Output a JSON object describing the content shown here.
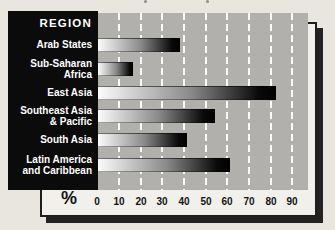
{
  "colors": {
    "page_bg": "#e9e6e0",
    "frame_bg": "#f2f0ea",
    "frame_border": "#1e1e1e",
    "shadow": "#222220",
    "plot_bg": "#b1b0ad",
    "panel_bg": "#0b0b0b",
    "gridline": "#ffffff",
    "label_text": "#ffffff",
    "axis_text": "#141414",
    "bar_gradient_start": "#fbfbfb",
    "bar_gradient_end": "#000000"
  },
  "chart_data": {
    "type": "bar",
    "orientation": "horizontal",
    "column_header": "REGION",
    "categories": [
      "Arab States",
      "Sub-Saharan Africa",
      "East Asia",
      "Southeast Asia & Pacific",
      "South Asia",
      "Latin America and Caribbean"
    ],
    "values": [
      38,
      16,
      82,
      54,
      41,
      61
    ],
    "xlabel": "%",
    "x_ticks": [
      "0",
      "10",
      "20",
      "30",
      "40",
      "50",
      "60",
      "70",
      "80",
      "90"
    ],
    "xlim": [
      0,
      97
    ],
    "grid": "vertical-dashed-white",
    "legend": "none",
    "bar_style": "white-to-black horizontal gradient"
  },
  "regions": [
    {
      "label": "Arab States",
      "value": 38
    },
    {
      "label": "Sub-Saharan\nAfrica",
      "value": 16
    },
    {
      "label": "East Asia",
      "value": 82
    },
    {
      "label": "Southeast Asia\n& Pacific",
      "value": 54
    },
    {
      "label": "South Asia",
      "value": 41
    },
    {
      "label": "Latin America\nand Caribbean",
      "value": 61
    }
  ]
}
